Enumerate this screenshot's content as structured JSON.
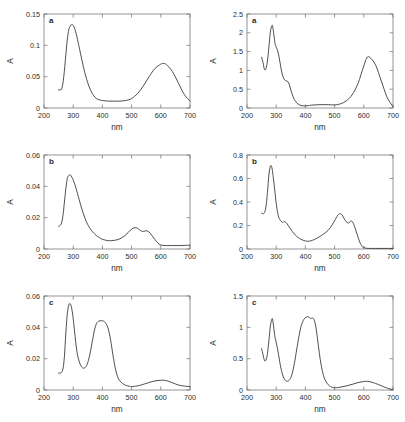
{
  "figure": {
    "line_color": "#3a3a3a",
    "axis_color": "#7a7a7a",
    "background": "#ffffff"
  },
  "chart_data": [
    {
      "id": "plot-a-left",
      "type": "line",
      "panel_letter": "a",
      "title": "",
      "xlabel": "nm",
      "ylabel": "A",
      "xlim": [
        200,
        700
      ],
      "ylim": [
        0,
        0.15
      ],
      "xticks": [
        200,
        300,
        400,
        500,
        600,
        700
      ],
      "xticklabels": [
        "200",
        "300",
        "400",
        "500",
        "600",
        "700"
      ],
      "yticks": [
        0,
        0.05,
        0.1,
        0.15
      ],
      "yticklabels": [
        "0",
        "0.05",
        "0.1",
        "0.15"
      ],
      "grid": false,
      "legend": "none",
      "series": [
        {
          "name": "absorbance",
          "x": [
            250,
            255,
            260,
            265,
            270,
            275,
            280,
            285,
            290,
            295,
            300,
            305,
            310,
            315,
            320,
            330,
            340,
            350,
            360,
            370,
            380,
            390,
            400,
            420,
            440,
            460,
            480,
            500,
            520,
            540,
            560,
            580,
            600,
            610,
            620,
            640,
            660,
            680,
            700
          ],
          "y": [
            0.029,
            0.029,
            0.03,
            0.04,
            0.06,
            0.086,
            0.11,
            0.125,
            0.131,
            0.133,
            0.132,
            0.127,
            0.119,
            0.109,
            0.098,
            0.076,
            0.056,
            0.04,
            0.028,
            0.02,
            0.015,
            0.013,
            0.012,
            0.011,
            0.011,
            0.011,
            0.012,
            0.015,
            0.023,
            0.035,
            0.05,
            0.063,
            0.07,
            0.071,
            0.069,
            0.058,
            0.04,
            0.022,
            0.011
          ]
        }
      ]
    },
    {
      "id": "plot-a-right",
      "type": "line",
      "panel_letter": "a",
      "title": "",
      "xlabel": "nm",
      "ylabel": "A",
      "xlim": [
        200,
        700
      ],
      "ylim": [
        0,
        2.5
      ],
      "xticks": [
        200,
        300,
        400,
        500,
        600,
        700
      ],
      "xticklabels": [
        "200",
        "300",
        "400",
        "500",
        "600",
        "700"
      ],
      "yticks": [
        0,
        0.5,
        1,
        1.5,
        2,
        2.5
      ],
      "yticklabels": [
        "0",
        "0.5",
        "1",
        "1.5",
        "2",
        "2.5"
      ],
      "grid": false,
      "legend": "none",
      "series": [
        {
          "name": "absorbance",
          "x": [
            250,
            255,
            260,
            265,
            270,
            275,
            280,
            285,
            288,
            292,
            296,
            300,
            305,
            310,
            315,
            320,
            325,
            330,
            335,
            340,
            345,
            350,
            360,
            370,
            380,
            390,
            400,
            410,
            420,
            440,
            460,
            480,
            500,
            520,
            540,
            560,
            580,
            600,
            610,
            620,
            640,
            660,
            680,
            700
          ],
          "y": [
            1.35,
            1.2,
            1.02,
            1.05,
            1.25,
            1.62,
            2.02,
            2.19,
            2.16,
            1.95,
            1.72,
            1.62,
            1.52,
            1.35,
            1.12,
            0.92,
            0.8,
            0.74,
            0.72,
            0.7,
            0.62,
            0.48,
            0.26,
            0.14,
            0.08,
            0.06,
            0.055,
            0.065,
            0.075,
            0.085,
            0.09,
            0.088,
            0.082,
            0.11,
            0.19,
            0.35,
            0.65,
            1.12,
            1.33,
            1.35,
            1.15,
            0.72,
            0.28,
            0.04
          ]
        }
      ]
    },
    {
      "id": "plot-b-left",
      "type": "line",
      "panel_letter": "b",
      "title": "",
      "xlabel": "nm",
      "ylabel": "A",
      "xlim": [
        200,
        700
      ],
      "ylim": [
        0,
        0.06
      ],
      "xticks": [
        200,
        300,
        400,
        500,
        600,
        700
      ],
      "xticklabels": [
        "200",
        "300",
        "400",
        "500",
        "600",
        "700"
      ],
      "yticks": [
        0,
        0.02,
        0.04,
        0.06
      ],
      "yticklabels": [
        "0",
        "0.02",
        "0.04",
        "0.06"
      ],
      "grid": false,
      "legend": "none",
      "series": [
        {
          "name": "absorbance",
          "x": [
            250,
            255,
            260,
            265,
            270,
            275,
            280,
            285,
            290,
            295,
            300,
            305,
            310,
            320,
            330,
            340,
            350,
            360,
            370,
            380,
            390,
            400,
            420,
            440,
            460,
            480,
            495,
            505,
            512,
            520,
            530,
            538,
            545,
            552,
            560,
            570,
            580,
            590,
            600,
            620,
            640,
            660,
            680,
            700
          ],
          "y": [
            0.0145,
            0.015,
            0.0165,
            0.0215,
            0.03,
            0.039,
            0.045,
            0.047,
            0.0473,
            0.046,
            0.044,
            0.0415,
            0.0385,
            0.0318,
            0.0253,
            0.0198,
            0.0155,
            0.0125,
            0.0102,
            0.0085,
            0.0072,
            0.0062,
            0.0053,
            0.0055,
            0.0065,
            0.009,
            0.0118,
            0.0132,
            0.0136,
            0.0133,
            0.0118,
            0.0112,
            0.0114,
            0.0116,
            0.0108,
            0.0085,
            0.006,
            0.0038,
            0.0025,
            0.0022,
            0.0022,
            0.0022,
            0.0023,
            0.0024
          ]
        }
      ]
    },
    {
      "id": "plot-b-right",
      "type": "line",
      "panel_letter": "b",
      "title": "",
      "xlabel": "nm",
      "ylabel": "A",
      "xlim": [
        200,
        700
      ],
      "ylim": [
        0,
        0.8
      ],
      "xticks": [
        200,
        300,
        400,
        500,
        600,
        700
      ],
      "xticklabels": [
        "200",
        "300",
        "400",
        "500",
        "600",
        "700"
      ],
      "yticks": [
        0,
        0.2,
        0.4,
        0.6,
        0.8
      ],
      "yticklabels": [
        "0",
        "0.2",
        "0.4",
        "0.6",
        "0.8"
      ],
      "grid": false,
      "legend": "none",
      "series": [
        {
          "name": "absorbance",
          "x": [
            250,
            255,
            260,
            265,
            270,
            275,
            280,
            285,
            290,
            295,
            300,
            305,
            310,
            320,
            328,
            335,
            345,
            355,
            365,
            375,
            385,
            395,
            405,
            415,
            425,
            440,
            455,
            470,
            485,
            500,
            510,
            518,
            524,
            532,
            540,
            548,
            556,
            562,
            570,
            578,
            586,
            594,
            600,
            610,
            620,
            640,
            660,
            680,
            700
          ],
          "y": [
            0.305,
            0.3,
            0.31,
            0.36,
            0.48,
            0.63,
            0.705,
            0.695,
            0.61,
            0.5,
            0.39,
            0.31,
            0.262,
            0.228,
            0.232,
            0.222,
            0.185,
            0.15,
            0.12,
            0.098,
            0.082,
            0.072,
            0.066,
            0.068,
            0.075,
            0.092,
            0.115,
            0.142,
            0.18,
            0.24,
            0.285,
            0.3,
            0.296,
            0.262,
            0.232,
            0.222,
            0.238,
            0.228,
            0.18,
            0.118,
            0.06,
            0.022,
            0.012,
            0.006,
            0.005,
            0.005,
            0.005,
            0.005,
            0.005
          ]
        }
      ]
    },
    {
      "id": "plot-c-left",
      "type": "line",
      "panel_letter": "c",
      "title": "",
      "xlabel": "nm",
      "ylabel": "A",
      "xlim": [
        200,
        700
      ],
      "ylim": [
        0,
        0.06
      ],
      "xticks": [
        200,
        300,
        400,
        500,
        600,
        700
      ],
      "xticklabels": [
        "200",
        "300",
        "400",
        "500",
        "600",
        "700"
      ],
      "yticks": [
        0,
        0.02,
        0.04,
        0.06
      ],
      "yticklabels": [
        "0",
        "0.02",
        "0.04",
        "0.06"
      ],
      "grid": false,
      "legend": "none",
      "series": [
        {
          "name": "absorbance",
          "x": [
            250,
            255,
            260,
            265,
            270,
            275,
            280,
            285,
            290,
            295,
            300,
            305,
            312,
            320,
            330,
            340,
            348,
            356,
            364,
            372,
            380,
            388,
            396,
            404,
            412,
            420,
            428,
            436,
            444,
            452,
            460,
            470,
            480,
            492,
            500,
            520,
            540,
            560,
            580,
            600,
            612,
            625,
            640,
            660,
            680,
            700
          ],
          "y": [
            0.0108,
            0.0108,
            0.0112,
            0.0135,
            0.0215,
            0.037,
            0.049,
            0.0543,
            0.055,
            0.052,
            0.0455,
            0.037,
            0.0255,
            0.0185,
            0.0145,
            0.0142,
            0.0165,
            0.0218,
            0.0295,
            0.0375,
            0.0425,
            0.044,
            0.0442,
            0.044,
            0.0425,
            0.039,
            0.032,
            0.0225,
            0.014,
            0.0085,
            0.0058,
            0.004,
            0.003,
            0.0024,
            0.0022,
            0.0026,
            0.0036,
            0.0048,
            0.0058,
            0.0062,
            0.0062,
            0.0057,
            0.0046,
            0.0032,
            0.0025,
            0.0022
          ]
        }
      ]
    },
    {
      "id": "plot-c-right",
      "type": "line",
      "panel_letter": "c",
      "title": "",
      "xlabel": "nm",
      "ylabel": "A",
      "xlim": [
        200,
        700
      ],
      "ylim": [
        0,
        1.5
      ],
      "xticks": [
        200,
        300,
        400,
        500,
        600,
        700
      ],
      "xticklabels": [
        "200",
        "300",
        "400",
        "500",
        "600",
        "700"
      ],
      "yticks": [
        0,
        0.5,
        1,
        1.5
      ],
      "yticklabels": [
        "0",
        "0.5",
        "1",
        "1.5"
      ],
      "grid": false,
      "legend": "none",
      "series": [
        {
          "name": "absorbance",
          "x": [
            250,
            255,
            260,
            265,
            270,
            275,
            280,
            285,
            288,
            292,
            296,
            300,
            306,
            314,
            322,
            330,
            338,
            346,
            354,
            362,
            370,
            378,
            386,
            394,
            402,
            410,
            418,
            424,
            430,
            436,
            442,
            448,
            454,
            462,
            470,
            478,
            486,
            494,
            500,
            520,
            540,
            560,
            580,
            600,
            612,
            625,
            640,
            660,
            680,
            700
          ],
          "y": [
            0.66,
            0.56,
            0.47,
            0.48,
            0.58,
            0.79,
            1.02,
            1.13,
            1.12,
            0.98,
            0.84,
            0.76,
            0.62,
            0.4,
            0.24,
            0.16,
            0.14,
            0.165,
            0.25,
            0.42,
            0.64,
            0.86,
            1.03,
            1.12,
            1.16,
            1.17,
            1.14,
            1.15,
            1.12,
            1.0,
            0.8,
            0.58,
            0.4,
            0.23,
            0.14,
            0.085,
            0.055,
            0.04,
            0.035,
            0.045,
            0.065,
            0.09,
            0.118,
            0.135,
            0.138,
            0.128,
            0.105,
            0.068,
            0.03,
            0.005
          ]
        }
      ]
    }
  ]
}
